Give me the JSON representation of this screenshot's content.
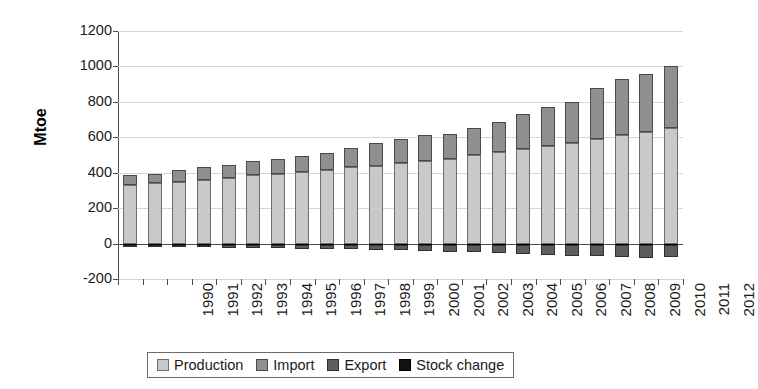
{
  "chart_data": {
    "type": "bar",
    "subtype": "stacked-bar-with-negative",
    "title": "",
    "xlabel": "",
    "ylabel": "Mtoe",
    "ylim": [
      -200,
      1200
    ],
    "ytick_step": 200,
    "yticks": [
      1200,
      1000,
      800,
      600,
      400,
      200,
      0,
      -200
    ],
    "ytick_labels": [
      "1200",
      "1000",
      "800",
      "600",
      "400",
      "200",
      "0",
      "-200"
    ],
    "grid": true,
    "grid_axis": "y",
    "legend_position": "bottom",
    "categories": [
      "1990",
      "1991",
      "1992",
      "1993",
      "1994",
      "1995",
      "1996",
      "1997",
      "1998",
      "1999",
      "2000",
      "2001",
      "2002",
      "2003",
      "2004",
      "2005",
      "2006",
      "2007",
      "2008",
      "2009",
      "2010",
      "2011",
      "2012"
    ],
    "series": [
      {
        "name": "Production",
        "color": "#c9c9c9",
        "values": [
          330,
          340,
          350,
          360,
          370,
          385,
          395,
          405,
          415,
          430,
          440,
          455,
          465,
          480,
          500,
          515,
          535,
          550,
          565,
          590,
          615,
          630,
          650
        ]
      },
      {
        "name": "Import",
        "color": "#8f8f8f",
        "values": [
          55,
          55,
          65,
          70,
          75,
          80,
          85,
          90,
          95,
          110,
          125,
          135,
          150,
          140,
          150,
          170,
          195,
          220,
          235,
          290,
          315,
          330,
          350
        ]
      },
      {
        "name": "Export",
        "color": "#5e5e5e",
        "values": [
          -12,
          -13,
          -14,
          -15,
          -17,
          -19,
          -20,
          -22,
          -24,
          -27,
          -30,
          -33,
          -36,
          -40,
          -44,
          -50,
          -54,
          -58,
          -62,
          -66,
          -70,
          -74,
          -72
        ]
      },
      {
        "name": "Stock change",
        "color": "#111111",
        "values": [
          -6,
          -6,
          -6,
          -6,
          -6,
          -6,
          -6,
          -6,
          -6,
          -6,
          -6,
          -6,
          -6,
          -6,
          -6,
          -6,
          -6,
          -6,
          -6,
          -6,
          -6,
          -6,
          -6
        ]
      }
    ],
    "totals_positive": [
      385,
      395,
      415,
      430,
      445,
      465,
      480,
      495,
      510,
      540,
      565,
      590,
      615,
      620,
      650,
      685,
      730,
      770,
      800,
      880,
      930,
      960,
      1000
    ]
  },
  "legend": {
    "items": [
      {
        "label": "Production",
        "swatch": "#c9c9c9",
        "border": "#6e6e6e"
      },
      {
        "label": "Import",
        "swatch": "#8f8f8f",
        "border": "#4a4a4a"
      },
      {
        "label": "Export",
        "swatch": "#5e5e5e",
        "border": "#303030"
      },
      {
        "label": "Stock change",
        "swatch": "#111111",
        "border": "#000000"
      }
    ]
  }
}
